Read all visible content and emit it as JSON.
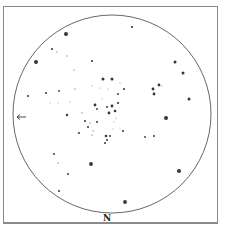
{
  "map": {
    "type": "star-chart",
    "circle": {
      "cx": 112,
      "cy": 114,
      "r": 99
    },
    "direction_label": "N",
    "pointer": {
      "x": 17,
      "y": 117,
      "direction": "left"
    },
    "colors": {
      "stroke": "#555555",
      "star": "#2a2a2a",
      "frame": "#8a8a8a"
    },
    "stars": [
      {
        "x": 132,
        "y": 27,
        "s": 1.1
      },
      {
        "x": 66,
        "y": 34,
        "s": 2.0
      },
      {
        "x": 52,
        "y": 49,
        "s": 1.0
      },
      {
        "x": 57,
        "y": 52,
        "s": 0.7
      },
      {
        "x": 67,
        "y": 56,
        "s": 0.7
      },
      {
        "x": 36,
        "y": 62,
        "s": 2.0
      },
      {
        "x": 92,
        "y": 61,
        "s": 1.0
      },
      {
        "x": 74,
        "y": 70,
        "s": 0.7
      },
      {
        "x": 175,
        "y": 62,
        "s": 1.5
      },
      {
        "x": 183,
        "y": 73,
        "s": 1.5
      },
      {
        "x": 103,
        "y": 79,
        "s": 1.5
      },
      {
        "x": 112,
        "y": 79,
        "s": 1.5
      },
      {
        "x": 120,
        "y": 83,
        "s": 0.6
      },
      {
        "x": 92,
        "y": 86,
        "s": 0.6
      },
      {
        "x": 124,
        "y": 89,
        "s": 1.0
      },
      {
        "x": 153,
        "y": 89,
        "s": 1.4
      },
      {
        "x": 159,
        "y": 85,
        "s": 1.4
      },
      {
        "x": 162,
        "y": 86,
        "s": 0.6
      },
      {
        "x": 154,
        "y": 94,
        "s": 1.4
      },
      {
        "x": 189,
        "y": 99,
        "s": 1.5
      },
      {
        "x": 28,
        "y": 96,
        "s": 1.0
      },
      {
        "x": 46,
        "y": 93,
        "s": 1.0
      },
      {
        "x": 59,
        "y": 91,
        "s": 0.9
      },
      {
        "x": 75,
        "y": 89,
        "s": 0.7
      },
      {
        "x": 118,
        "y": 94,
        "s": 1.0
      },
      {
        "x": 102,
        "y": 99,
        "s": 0.6
      },
      {
        "x": 95,
        "y": 105,
        "s": 1.4
      },
      {
        "x": 112,
        "y": 106,
        "s": 1.4
      },
      {
        "x": 107,
        "y": 107,
        "s": 1.0
      },
      {
        "x": 118,
        "y": 103,
        "s": 1.1
      },
      {
        "x": 115,
        "y": 111,
        "s": 1.3
      },
      {
        "x": 109,
        "y": 113,
        "s": 1.4
      },
      {
        "x": 97,
        "y": 109,
        "s": 0.9
      },
      {
        "x": 116,
        "y": 118,
        "s": 0.6
      },
      {
        "x": 67,
        "y": 115,
        "s": 1.2
      },
      {
        "x": 166,
        "y": 118,
        "s": 2.0
      },
      {
        "x": 82,
        "y": 113,
        "s": 0.7
      },
      {
        "x": 85,
        "y": 121,
        "s": 1.0
      },
      {
        "x": 97,
        "y": 122,
        "s": 1.0
      },
      {
        "x": 90,
        "y": 123,
        "s": 0.7
      },
      {
        "x": 88,
        "y": 127,
        "s": 1.0
      },
      {
        "x": 93,
        "y": 131,
        "s": 0.7
      },
      {
        "x": 123,
        "y": 131,
        "s": 1.0
      },
      {
        "x": 79,
        "y": 133,
        "s": 1.0
      },
      {
        "x": 92,
        "y": 135,
        "s": 0.7
      },
      {
        "x": 106,
        "y": 136,
        "s": 1.3
      },
      {
        "x": 110,
        "y": 136,
        "s": 1.0
      },
      {
        "x": 107,
        "y": 140,
        "s": 1.0
      },
      {
        "x": 105,
        "y": 143,
        "s": 1.0
      },
      {
        "x": 145,
        "y": 137,
        "s": 0.9
      },
      {
        "x": 154,
        "y": 136,
        "s": 1.0
      },
      {
        "x": 54,
        "y": 154,
        "s": 1.0
      },
      {
        "x": 58,
        "y": 163,
        "s": 0.7
      },
      {
        "x": 91,
        "y": 164,
        "s": 1.9
      },
      {
        "x": 68,
        "y": 174,
        "s": 1.0
      },
      {
        "x": 179,
        "y": 171,
        "s": 2.0
      },
      {
        "x": 59,
        "y": 191,
        "s": 1.0
      },
      {
        "x": 125,
        "y": 202,
        "s": 1.9
      },
      {
        "x": 50,
        "y": 103,
        "s": 0.5
      },
      {
        "x": 58,
        "y": 103,
        "s": 0.5
      },
      {
        "x": 70,
        "y": 102,
        "s": 0.5
      },
      {
        "x": 100,
        "y": 88,
        "s": 0.5
      },
      {
        "x": 108,
        "y": 89,
        "s": 0.5
      },
      {
        "x": 114,
        "y": 122,
        "s": 0.5
      },
      {
        "x": 120,
        "y": 128,
        "s": 0.5
      },
      {
        "x": 113,
        "y": 129,
        "s": 0.5
      }
    ]
  }
}
